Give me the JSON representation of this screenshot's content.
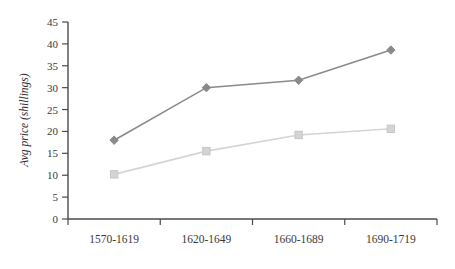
{
  "chart_data": {
    "type": "line",
    "title": "",
    "xlabel": "",
    "ylabel": "Avg price (shillings)",
    "categories": [
      "1570-1619",
      "1620-1649",
      "1660-1689",
      "1690-1719"
    ],
    "ylim": [
      0,
      45
    ],
    "yticks": [
      0,
      5,
      10,
      15,
      20,
      25,
      30,
      35,
      40,
      45
    ],
    "ytick_labels": [
      "0",
      "5",
      "10",
      "15",
      "20",
      "25",
      "30",
      "35",
      "40",
      "45"
    ],
    "grid": false,
    "legend": "none",
    "series": [
      {
        "name": "series-1",
        "marker": "diamond",
        "color": "#8a8a8a",
        "values": [
          18.0,
          30.0,
          31.7,
          38.6
        ]
      },
      {
        "name": "series-2",
        "marker": "square",
        "color": "#d4d4d4",
        "values": [
          10.2,
          15.5,
          19.2,
          20.6
        ]
      }
    ]
  },
  "axis": {
    "line_color": "#4a4a4a"
  }
}
